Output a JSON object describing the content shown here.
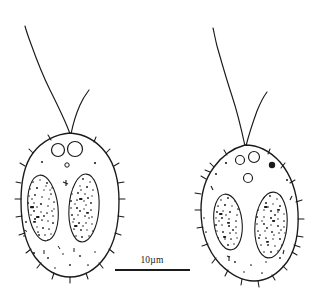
{
  "figure": {
    "type": "scientific-line-drawing",
    "background_color": "#ffffff",
    "ink_color": "#1a1a1a",
    "width": 318,
    "height": 298,
    "caption": ""
  },
  "scalebar": {
    "label": "10µm",
    "value": 10,
    "unit": "µm",
    "bar_x_start": 115,
    "bar_x_end": 190,
    "bar_y": 270,
    "label_x": 152,
    "label_y": 263,
    "color": "#1a1a1a"
  },
  "cells": [
    {
      "id": "cell-left",
      "name": "left-cell",
      "shape": "broad-oval",
      "center_x": 70,
      "center_y": 205,
      "radius_x": 48,
      "radius_y": 72,
      "apex_x": 70,
      "apex_y": 133,
      "flagella": [
        {
          "id": "flagellum-left-long",
          "name": "long-flagellum",
          "length": "long",
          "direction": "upper-left"
        },
        {
          "id": "flagellum-left-short",
          "name": "short-flagellum",
          "length": "short",
          "direction": "upper-right"
        }
      ],
      "vacuoles": [
        {
          "name": "contractile-vacuole",
          "cx": 58,
          "cy": 150,
          "r": 6.5,
          "filled": false
        },
        {
          "name": "contractile-vacuole",
          "cx": 75,
          "cy": 149,
          "r": 7.5,
          "filled": false
        },
        {
          "name": "small-granule",
          "cx": 67,
          "cy": 165,
          "r": 2.2,
          "filled": false
        }
      ],
      "chloroplasts": [
        {
          "name": "chloroplast",
          "cx": 43,
          "cy": 208,
          "rx": 15,
          "ry": 33,
          "rotation": -6,
          "texture": "stippled"
        },
        {
          "name": "chloroplast",
          "cx": 84,
          "cy": 208,
          "rx": 15,
          "ry": 34,
          "rotation": 4,
          "texture": "stippled"
        }
      ],
      "spine_count": 22
    },
    {
      "id": "cell-right",
      "name": "right-cell",
      "shape": "pear-egg-shaped",
      "center_x": 250,
      "center_y": 215,
      "radius_x": 48,
      "radius_y": 68,
      "apex_x": 245,
      "apex_y": 145,
      "flagella": [
        {
          "id": "flagellum-right-long",
          "name": "long-flagellum",
          "length": "long",
          "direction": "upper-left"
        },
        {
          "id": "flagellum-right-short",
          "name": "short-flagellum",
          "length": "short",
          "direction": "upper-right"
        }
      ],
      "vacuoles": [
        {
          "name": "contractile-vacuole",
          "cx": 240,
          "cy": 160,
          "r": 4.5,
          "filled": false
        },
        {
          "name": "contractile-vacuole",
          "cx": 254,
          "cy": 157,
          "r": 5.5,
          "filled": false
        },
        {
          "name": "eyespot",
          "cx": 272,
          "cy": 165,
          "r": 3.2,
          "filled": true
        },
        {
          "name": "contractile-vacuole",
          "cx": 248,
          "cy": 178,
          "r": 4.5,
          "filled": false
        }
      ],
      "chloroplasts": [
        {
          "name": "chloroplast",
          "cx": 228,
          "cy": 222,
          "rx": 14,
          "ry": 28,
          "rotation": -7,
          "texture": "stippled"
        },
        {
          "name": "chloroplast",
          "cx": 271,
          "cy": 225,
          "rx": 16,
          "ry": 33,
          "rotation": 5,
          "texture": "stippled"
        }
      ],
      "spine_count": 22
    }
  ]
}
